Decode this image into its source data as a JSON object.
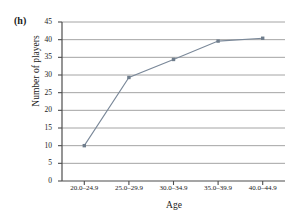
{
  "figure": {
    "panel_label": "(h)",
    "background_color": "#ffffff"
  },
  "chart_data": {
    "type": "line",
    "title": "",
    "subtitle": "",
    "xlabel": "Age",
    "ylabel": "Number of players",
    "categories": [
      "20.0–24.9",
      "25.0–29.9",
      "30.0–34.9",
      "35.0–39.9",
      "40.0–44.9"
    ],
    "values": [
      10,
      29.3,
      34.4,
      39.6,
      40.4
    ],
    "series": [
      {
        "name": "Cumulative number of players",
        "values": [
          10,
          29.3,
          34.4,
          39.6,
          40.4
        ]
      }
    ],
    "ylim": [
      0,
      45
    ],
    "ytick_values": [
      0,
      5,
      10,
      15,
      20,
      25,
      30,
      35,
      40,
      45
    ],
    "ytick_labels": [
      "0",
      "5",
      "10",
      "15",
      "20",
      "25",
      "30",
      "35",
      "40",
      "45"
    ],
    "xtick_labels": [
      "20.0–24.9",
      "25.0–29.9",
      "30.0–34.9",
      "35.0–39.9",
      "40.0–44.9"
    ],
    "grid": true,
    "grid_axis": "y",
    "legend": false,
    "legend_position": "none",
    "marker": "square",
    "line_color": "#7a8899",
    "grid_color": "#9a9a9a",
    "axis_color": "#4d4d4d",
    "marker_color": "#6f7d8c",
    "annotations": []
  }
}
